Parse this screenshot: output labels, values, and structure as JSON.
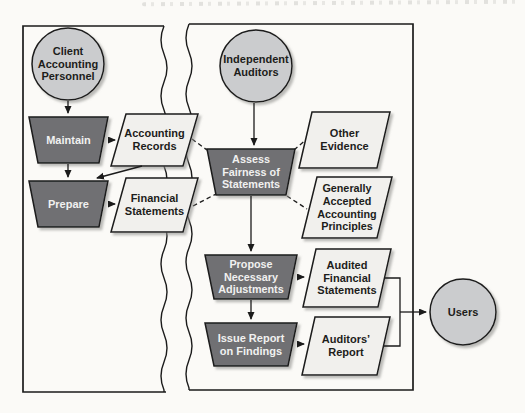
{
  "figure": {
    "nodes": {
      "client": "Client\nAccounting\nPersonnel",
      "maintain": "Maintain",
      "accounting_records": "Accounting\nRecords",
      "prepare": "Prepare",
      "financial_statements": "Financial\nStatements",
      "independent_auditors": "Independent\nAuditors",
      "assess": "Assess\nFairness of\nStatements",
      "other_evidence": "Other\nEvidence",
      "gaap": "Generally\nAccepted\nAccounting\nPrinciples",
      "propose": "Propose\nNecessary\nAdjustments",
      "issue_report": "Issue Report\non Findings",
      "audited_financial_statements": "Audited\nFinancial\nStatements",
      "auditors_report": "Auditors’\nReport",
      "users": "Users"
    },
    "connections": [
      {
        "from": "client",
        "to": "maintain",
        "style": "solid"
      },
      {
        "from": "maintain",
        "to": "accounting_records",
        "style": "solid"
      },
      {
        "from": "maintain",
        "to": "prepare",
        "style": "solid"
      },
      {
        "from": "accounting_records",
        "to": "prepare",
        "style": "solid"
      },
      {
        "from": "prepare",
        "to": "financial_statements",
        "style": "solid"
      },
      {
        "from": "independent_auditors",
        "to": "assess",
        "style": "solid"
      },
      {
        "from": "accounting_records",
        "to": "assess",
        "style": "dashed"
      },
      {
        "from": "financial_statements",
        "to": "assess",
        "style": "dashed"
      },
      {
        "from": "assess",
        "to": "other_evidence",
        "style": "dashed"
      },
      {
        "from": "assess",
        "to": "gaap",
        "style": "dashed"
      },
      {
        "from": "assess",
        "to": "propose",
        "style": "solid"
      },
      {
        "from": "propose",
        "to": "audited_financial_statements",
        "style": "solid"
      },
      {
        "from": "propose",
        "to": "issue_report",
        "style": "solid"
      },
      {
        "from": "issue_report",
        "to": "auditors_report",
        "style": "solid"
      },
      {
        "from": "audited_financial_statements",
        "to": "users",
        "style": "solid"
      },
      {
        "from": "auditors_report",
        "to": "users",
        "style": "solid"
      }
    ],
    "colors": {
      "process_fill": "#6f7073",
      "document_fill": "#f1f0ed",
      "actor_fill": "#cbccce",
      "outline": "#1b1b1b",
      "background": "#fbfaf7",
      "shadow": "#8f8f8c"
    }
  }
}
